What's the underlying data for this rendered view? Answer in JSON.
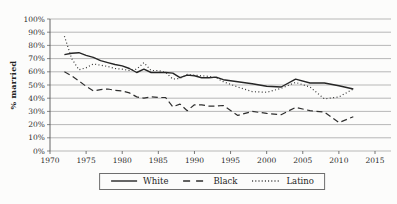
{
  "chart_data": {
    "type": "line",
    "title": "",
    "xlabel": "",
    "ylabel": "% married",
    "xlim": [
      1970,
      2015
    ],
    "ylim": [
      0,
      100
    ],
    "grid": "horizontal",
    "legend_position": "bottom-center-boxed",
    "x_tick_labels": [
      "1970",
      "1975",
      "1980",
      "1985",
      "1990",
      "1995",
      "2000",
      "2005",
      "2010",
      "2015"
    ],
    "y_tick_labels": [
      "0%",
      "10%",
      "20%",
      "30%",
      "40%",
      "50%",
      "60%",
      "70%",
      "80%",
      "90%",
      "100%"
    ],
    "x": [
      1972,
      1973,
      1974,
      1975,
      1976,
      1977,
      1978,
      1979,
      1980,
      1981,
      1982,
      1983,
      1984,
      1985,
      1986,
      1987,
      1988,
      1989,
      1990,
      1991,
      1992,
      1993,
      1994,
      1996,
      1998,
      2000,
      2002,
      2004,
      2006,
      2008,
      2010,
      2012
    ],
    "series": [
      {
        "name": "White",
        "style": "solid",
        "color": "#262626",
        "values": [
          73,
          74,
          74.5,
          72.5,
          71,
          68.5,
          67,
          65.5,
          64.5,
          62.5,
          59.5,
          62,
          59.5,
          59.5,
          59.5,
          59,
          55.5,
          57.5,
          57,
          55.5,
          55.5,
          56,
          54,
          52.5,
          51,
          49,
          48.5,
          54.5,
          51.5,
          51.5,
          49.5,
          47
        ]
      },
      {
        "name": "Black",
        "style": "dashed",
        "color": "#2e2e2e",
        "values": [
          60,
          57,
          53,
          49,
          45.5,
          46.5,
          47,
          46,
          45.5,
          44,
          41,
          40,
          41,
          40.5,
          40.5,
          33.5,
          35.5,
          30.5,
          35,
          35,
          34,
          34,
          34.5,
          27,
          30,
          28.5,
          27.5,
          33,
          30.5,
          29.5,
          21.5,
          26
        ]
      },
      {
        "name": "Latino",
        "style": "dotted",
        "color": "#333333",
        "values": [
          87,
          70,
          61.5,
          63,
          66,
          65,
          64,
          62.5,
          62,
          61,
          62,
          67,
          61,
          61,
          59.5,
          54.5,
          55,
          58,
          57.5,
          57,
          56.5,
          55.5,
          52.5,
          48.5,
          45,
          44.5,
          47.5,
          52,
          48.5,
          39.5,
          41,
          47
        ]
      }
    ],
    "colors": {
      "grid": "#9b9b9b",
      "axis": "#555555",
      "tick_text": "#2e2e2e"
    }
  },
  "axes": {
    "y_title": "% married"
  }
}
